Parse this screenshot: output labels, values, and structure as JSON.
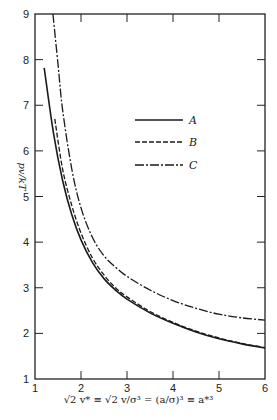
{
  "chart_data": {
    "type": "line",
    "title": "",
    "xlabel": "√2 v* ≡ √2 v/σ³ = (a/σ)³ ≡ a*³",
    "ylabel": "pv/kT",
    "xlim": [
      1,
      6
    ],
    "ylim": [
      1,
      9
    ],
    "xticks": [
      1,
      2,
      3,
      4,
      5,
      6
    ],
    "yticks": [
      1,
      2,
      3,
      4,
      5,
      6,
      7,
      8,
      9
    ],
    "grid": false,
    "legend_position": "upper center",
    "series": [
      {
        "name": "A",
        "style": "solid",
        "x": [
          1.2,
          1.4,
          1.6,
          1.8,
          2.0,
          2.25,
          2.5,
          2.75,
          3.0,
          3.5,
          4.0,
          4.5,
          5.0,
          5.5,
          6.0
        ],
        "y": [
          7.82,
          6.4,
          5.35,
          4.6,
          4.05,
          3.55,
          3.2,
          2.95,
          2.75,
          2.45,
          2.22,
          2.03,
          1.88,
          1.77,
          1.68
        ]
      },
      {
        "name": "B",
        "style": "dashed",
        "x": [
          1.43,
          1.6,
          1.8,
          2.0,
          2.25,
          2.5,
          2.75,
          3.0,
          3.5,
          4.0,
          4.5,
          5.0,
          5.5,
          6.0
        ],
        "y": [
          6.7,
          5.6,
          4.8,
          4.2,
          3.65,
          3.28,
          3.0,
          2.8,
          2.48,
          2.24,
          2.05,
          1.9,
          1.78,
          1.69
        ]
      },
      {
        "name": "C",
        "style": "dash-dot",
        "x": [
          1.39,
          1.5,
          1.6,
          1.8,
          2.0,
          2.25,
          2.5,
          2.75,
          3.0,
          3.5,
          4.0,
          4.5,
          5.0,
          5.5,
          6.0
        ],
        "y": [
          9.0,
          7.9,
          6.9,
          5.6,
          4.75,
          4.1,
          3.7,
          3.45,
          3.25,
          2.95,
          2.72,
          2.55,
          2.42,
          2.34,
          2.29
        ]
      }
    ]
  },
  "labels": {
    "ylabel": "pv/kT",
    "xlabel": "√2 v* ≡ √2 v/σ³ = (a/σ)³ ≡ a*³"
  }
}
